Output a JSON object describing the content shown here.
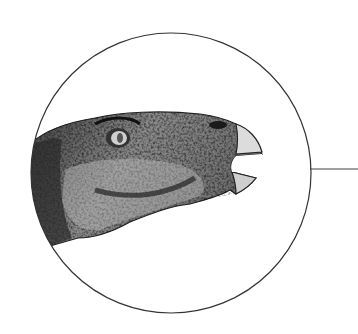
{
  "figure": {
    "circle": {
      "cx": 171,
      "cy": 173,
      "r": 140,
      "stroke": "#333333"
    },
    "leader_line": {
      "x1": 310,
      "y1": 169,
      "x2": 358,
      "y2": 169,
      "stroke": "#444444"
    },
    "colors": {
      "skin_dark": "#2a2a2a",
      "skin_mid": "#6b6b6b",
      "skin_light": "#b5b5b5",
      "beak": "#d8d8d8",
      "background": "#ffffff"
    }
  }
}
